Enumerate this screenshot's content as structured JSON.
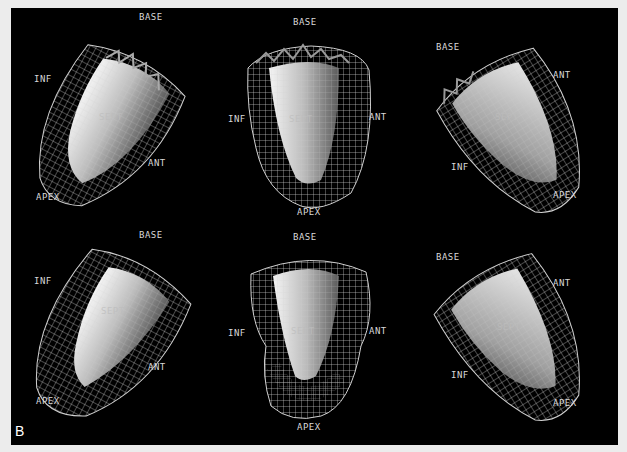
{
  "figure": {
    "panel_letter": "B",
    "colors": {
      "background": "#000000",
      "border": "#ececec",
      "wire": "#cfcfcf",
      "label": "#d8d8d8"
    },
    "rows": [
      {
        "name": "top-row",
        "views": [
          {
            "name": "view-left-oblique",
            "labels": {
              "base": "BASE",
              "inf": "INF",
              "sept": "SEPT",
              "ant": "ANT",
              "apex": "APEX"
            }
          },
          {
            "name": "view-septal",
            "labels": {
              "base": "BASE",
              "inf": "INF",
              "sept": "SEPT",
              "ant": "ANT",
              "apex": "APEX"
            }
          },
          {
            "name": "view-right-oblique",
            "labels": {
              "base": "BASE",
              "ant": "ANT",
              "sept": "SEPT",
              "inf": "INF",
              "apex": "APEX"
            }
          }
        ]
      },
      {
        "name": "bottom-row",
        "views": [
          {
            "name": "view-left-oblique",
            "labels": {
              "base": "BASE",
              "inf": "INF",
              "sept": "SEPT",
              "ant": "ANT",
              "apex": "APEX"
            }
          },
          {
            "name": "view-septal",
            "labels": {
              "base": "BASE",
              "inf": "INF",
              "sept": "SEPT",
              "ant": "ANT",
              "apex": "APEX"
            }
          },
          {
            "name": "view-right-oblique",
            "labels": {
              "base": "BASE",
              "ant": "ANT",
              "sept": "SEPT",
              "inf": "INF",
              "apex": "APEX"
            }
          }
        ]
      }
    ]
  }
}
